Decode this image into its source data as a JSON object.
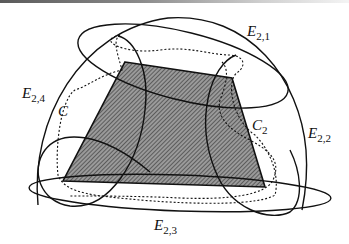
{
  "figure": {
    "type": "set-diagram",
    "labels": {
      "e21": {
        "main": "E",
        "sub": "2,1"
      },
      "e22": {
        "main": "E",
        "sub": "2,2"
      },
      "e23": {
        "main": "E",
        "sub": "2,3"
      },
      "e24": {
        "main": "E",
        "sub": "2,4"
      },
      "c": {
        "main": "C"
      },
      "c2": {
        "main": "C",
        "sub": "2"
      }
    },
    "colors": {
      "stroke": "#111111",
      "shade_fill": "#8c8c8c",
      "hatch": "#3a3a3a",
      "background": "#ffffff"
    }
  }
}
